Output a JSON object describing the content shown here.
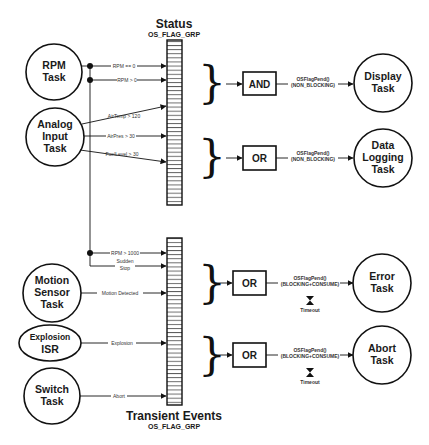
{
  "groups": {
    "status": {
      "title": "Status",
      "subtitle": "OS_FLAG_GRP"
    },
    "transient": {
      "title": "Transient Events",
      "subtitle": "OS_FLAG_GRP"
    }
  },
  "producers": {
    "rpm": {
      "line1": "RPM",
      "line2": "Task"
    },
    "analog": {
      "line1": "Analog",
      "line2": "Input",
      "line3": "Task"
    },
    "motion": {
      "line1": "Motion",
      "line2": "Sensor",
      "line3": "Task"
    },
    "explosion": {
      "line1": "Explosion",
      "line2": "ISR"
    },
    "switch": {
      "line1": "Switch",
      "line2": "Task"
    }
  },
  "signals": {
    "rpm_eq_0": "RPM == 0",
    "rpm_gt_0": "RPM > 0",
    "airtemp": "AirTemp > 120",
    "airpres": "AirPres > 30",
    "fuellevel": "FuelLevel > 30",
    "rpm_gt_1000": "RPM > 1000",
    "sudden_stop_1": "Sudden",
    "sudden_stop_2": "Stop",
    "motion_detected": "Motion Detected",
    "explosion": "Explosion",
    "abort": "Abort"
  },
  "gates": {
    "g1": "AND",
    "g2": "OR",
    "g3": "OR",
    "g4": "OR"
  },
  "pends": {
    "p1": {
      "call": "OSFlagPend()",
      "mode": "(NON_BLOCKING)"
    },
    "p2": {
      "call": "OSFlagPend()",
      "mode": "(NON_BLOCKING)"
    },
    "p3": {
      "call": "OSFlagPend()",
      "mode": "(BLOCKING+CONSUME)",
      "timeout": "Timeout"
    },
    "p4": {
      "call": "OSFlagPend()",
      "mode": "(BLOCKING+CONSUME)",
      "timeout": "Timeout"
    }
  },
  "consumers": {
    "display": {
      "line1": "Display",
      "line2": "Task"
    },
    "datalog": {
      "line1": "Data",
      "line2": "Logging",
      "line3": "Task"
    },
    "error": {
      "line1": "Error",
      "line2": "Task"
    },
    "abort": {
      "line1": "Abort",
      "line2": "Task"
    }
  },
  "colors": {
    "ink": "#111111",
    "background": "#ffffff"
  }
}
